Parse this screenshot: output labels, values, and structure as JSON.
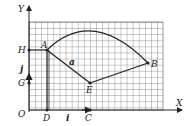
{
  "diagram": {
    "axes": {
      "x_label": "X",
      "y_label": "Y",
      "origin_label": "O"
    },
    "points": [
      {
        "name": "H",
        "x": 29,
        "y": 50
      },
      {
        "name": "A",
        "x": 47,
        "y": 50
      },
      {
        "name": "G",
        "x": 29,
        "y": 83
      },
      {
        "name": "D",
        "x": 47,
        "y": 110
      },
      {
        "name": "C",
        "x": 90,
        "y": 110
      },
      {
        "name": "E",
        "x": 90,
        "y": 83
      },
      {
        "name": "B",
        "x": 148,
        "y": 63
      }
    ],
    "labels": {
      "H": "H",
      "A": "A",
      "G": "G",
      "D": "D",
      "C": "C",
      "E": "E",
      "B": "B",
      "a": "a",
      "i": "i",
      "j": "j"
    },
    "colors": {
      "grid": "#555555",
      "line": "#222222",
      "background": "#ffffff"
    }
  }
}
